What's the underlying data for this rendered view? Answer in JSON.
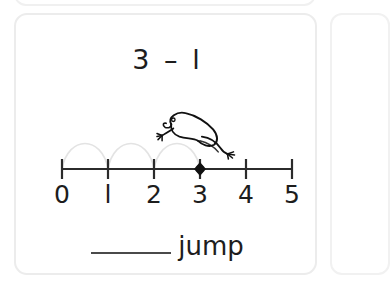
{
  "worksheet": {
    "card": {
      "equation": "3 – l",
      "equation_parts": {
        "minuend": "3",
        "operator": "–",
        "subtrahend": "l"
      },
      "answer": {
        "blank_label": "",
        "word": "jump"
      },
      "numberline": {
        "tick_labels": [
          "0",
          "l",
          "2",
          "3",
          "4",
          "5"
        ],
        "tick_values": [
          0,
          1,
          2,
          3,
          4,
          5
        ],
        "marker_value": 3,
        "marker_label": "3",
        "hops": [
          {
            "from": 0,
            "to": 1
          },
          {
            "from": 1,
            "to": 2
          },
          {
            "from": 2,
            "to": 3
          }
        ],
        "frog_position": 3,
        "frog_icon": "leaping-frog-icon",
        "line_color": "#2b2b2b",
        "hop_color": "#e2e2e2",
        "marker_color": "#111111",
        "label_color": "#1d1d1d"
      }
    },
    "neighbors": {
      "above_visible": true,
      "right_visible": true,
      "card_border_color": "#ececec"
    }
  }
}
